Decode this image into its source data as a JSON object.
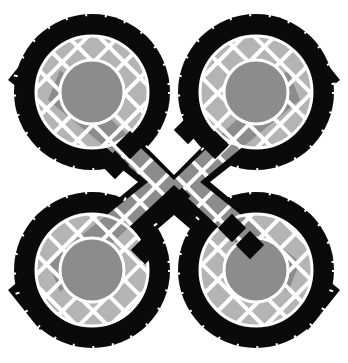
{
  "image": {
    "description": "Mosaic tile pattern: two interlocking loops forming a quatrefoil-like knot with black outer borders and gray tiles",
    "colors": {
      "background": "#ffffff",
      "outer_border": "#0a0a0a",
      "light_gray": "#b4b4b4",
      "mid_gray": "#8c8c8c",
      "grout": "#ffffff"
    }
  }
}
